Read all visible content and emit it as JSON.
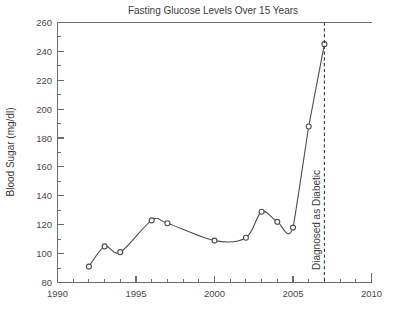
{
  "chart_data": {
    "type": "line",
    "title": "Fasting Glucose Levels Over 15 Years",
    "xlabel": "",
    "ylabel": "Blood Sugar (mg/dl)",
    "xlim": [
      1990,
      2010
    ],
    "ylim": [
      80,
      260
    ],
    "grid": false,
    "legend": "none",
    "x_major_ticks": [
      1990,
      1995,
      2000,
      2005,
      2010
    ],
    "x_major_tick_labels": [
      "1990",
      "1995",
      "2000",
      "2005",
      "2010"
    ],
    "x_minor_tick_step": 1,
    "y_major_ticks": [
      80,
      100,
      120,
      140,
      160,
      180,
      200,
      220,
      240,
      260
    ],
    "y_major_tick_labels": [
      "80",
      "100",
      "120",
      "140",
      "160",
      "180",
      "200",
      "220",
      "240",
      "260"
    ],
    "y_minor_tick_step": 10,
    "series": [
      {
        "name": "Blood Sugar",
        "marker": "open-circle",
        "color": "#4d4d4d",
        "x": [
          1992,
          1993,
          1994,
          1996,
          1997,
          2000,
          2002,
          2003,
          2004,
          2005,
          2006,
          2007
        ],
        "values": [
          91,
          105,
          101,
          123,
          121,
          109,
          111,
          129,
          122,
          118,
          188,
          245
        ]
      }
    ],
    "annotations": [
      {
        "label": "Diagnosed as Diabetic",
        "type": "vertical-dashed-line",
        "x": 2007,
        "orientation": "vertical-text",
        "color": "#3a3a3a"
      }
    ]
  },
  "figure": {
    "background": "#ffffff",
    "axis_color": "#6b6b6b",
    "text_color": "#3a3a3a"
  }
}
